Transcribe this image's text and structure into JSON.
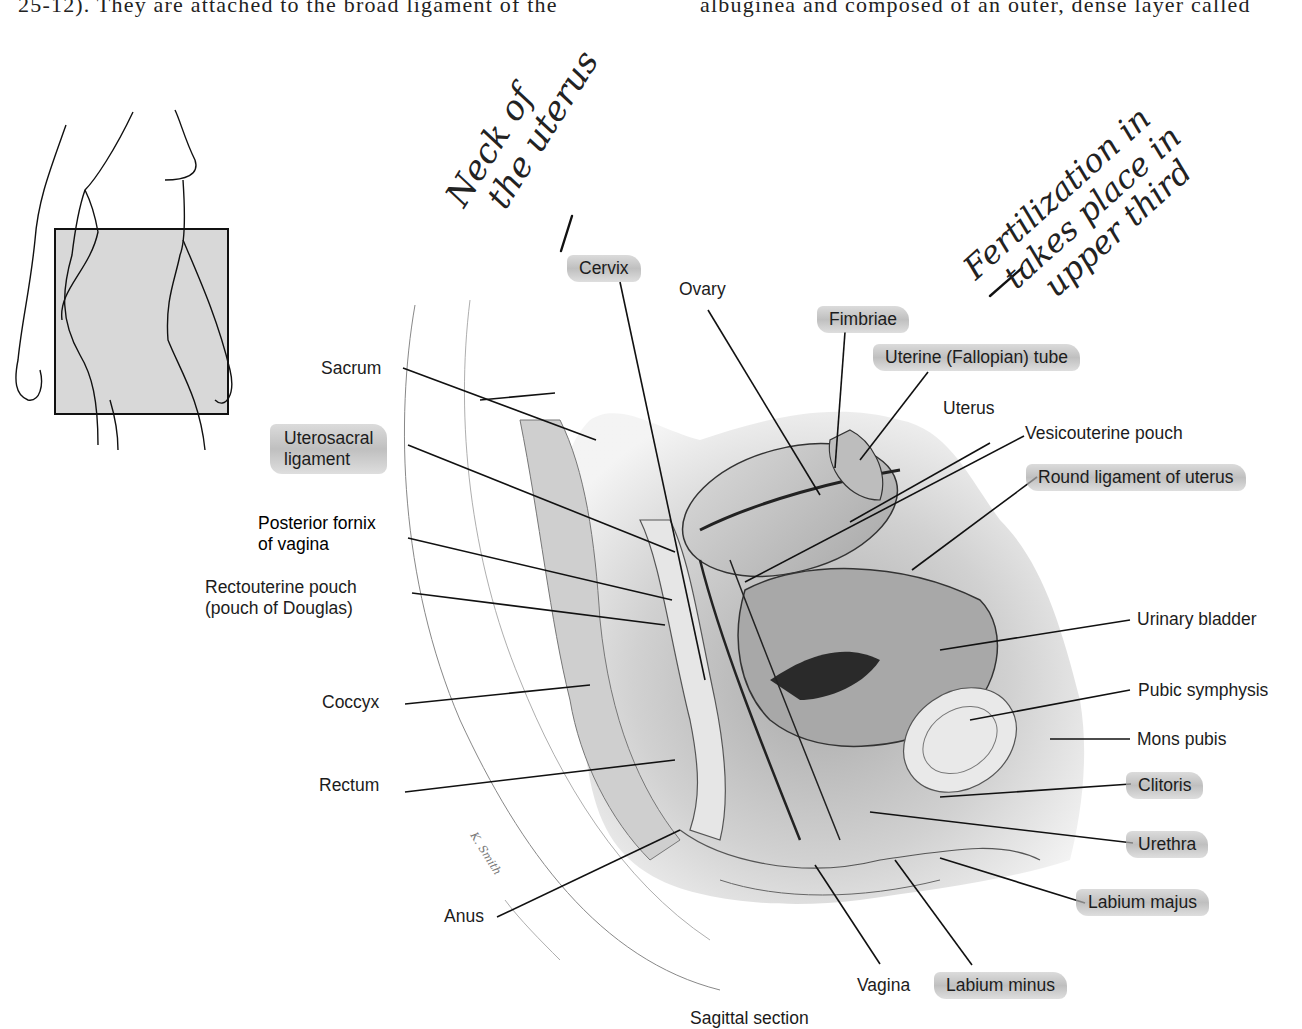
{
  "page_text": {
    "top_left": "25-12). They are attached to the broad ligament of the",
    "top_right": "albuginea and composed of an outer, dense layer called"
  },
  "handwriting": {
    "note_neck": [
      "Neck of",
      "the uterus"
    ],
    "note_fertilization": [
      "Fertilization in",
      "takes place in",
      "upper third"
    ]
  },
  "figure": {
    "caption": "Sagittal section",
    "inset": "body-outline-inset-icon",
    "labels": {
      "cervix": "Cervix",
      "ovary": "Ovary",
      "fimbriae": "Fimbriae",
      "uterine_tube": "Uterine (Fallopian) tube",
      "uterus": "Uterus",
      "vesicouterine_pouch": "Vesicouterine pouch",
      "round_ligament": "Round ligament of uterus",
      "urinary_bladder": "Urinary bladder",
      "pubic_symphysis": "Pubic symphysis",
      "mons_pubis": "Mons pubis",
      "clitoris": "Clitoris",
      "urethra": "Urethra",
      "labium_majus": "Labium majus",
      "labium_minus": "Labium minus",
      "vagina": "Vagina",
      "anus": "Anus",
      "rectum": "Rectum",
      "coccyx": "Coccyx",
      "rectouterine_pouch_1": "Rectouterine pouch",
      "rectouterine_pouch_2": "(pouch of Douglas)",
      "posterior_fornix_1": "Posterior fornix",
      "posterior_fornix_2": "of vagina",
      "uterosacral_1": "Uterosacral",
      "uterosacral_2": "ligament",
      "sacrum": "Sacrum"
    },
    "highlighted": [
      "Cervix",
      "Fimbriae",
      "Uterine (Fallopian) tube",
      "Round ligament of uterus",
      "Uterosacral ligament",
      "Clitoris",
      "Urethra",
      "Labium majus",
      "Labium minus"
    ],
    "colors": {
      "highlight": "#b4b4b4",
      "ink": "#1a1a1a",
      "tissue": "#cfcfcf"
    }
  }
}
